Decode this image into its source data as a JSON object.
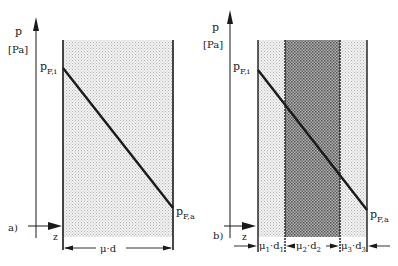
{
  "panel_a": {
    "tag": "a)",
    "y_axis_symbol": "p",
    "y_axis_unit": "[Pa]",
    "x_axis_symbol": "z",
    "p_inner": {
      "base": "p",
      "sub": "F,i"
    },
    "p_outer": {
      "base": "p",
      "sub": "F,a"
    },
    "layers": [
      {
        "label_mu": "μ",
        "label_sep": "·",
        "label_d": "d",
        "index": "",
        "fill": "light"
      }
    ]
  },
  "panel_b": {
    "tag": "b)",
    "y_axis_symbol": "p",
    "y_axis_unit": "[Pa]",
    "x_axis_symbol": "z",
    "p_inner": {
      "base": "p",
      "sub": "F,i"
    },
    "p_outer": {
      "base": "p",
      "sub": "F,a"
    },
    "layers": [
      {
        "label_mu": "μ",
        "label_sep": "·",
        "label_d": "d",
        "index": "1",
        "fill": "light"
      },
      {
        "label_mu": "μ",
        "label_sep": "·",
        "label_d": "d",
        "index": "2",
        "fill": "dark"
      },
      {
        "label_mu": "μ",
        "label_sep": "·",
        "label_d": "d",
        "index": "3",
        "fill": "light"
      }
    ]
  },
  "colors": {
    "ink": "#1a1a1a",
    "light_fill": "#e4e4e4",
    "dark_fill": "#9a9a9a"
  }
}
